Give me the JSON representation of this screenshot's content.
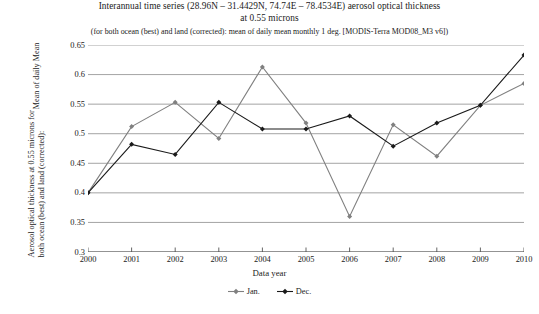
{
  "chart_data": {
    "type": "line",
    "title": "Interannual time series (28.96N – 31.4429N, 74.74E – 78.4534E) aerosol optical thickness",
    "title_line2": "at 0.55 microns",
    "subtitle": "(for both ocean (best) and land (corrected): mean of daily mean monthly 1 deg. [MODIS-Terra MOD08_M3 v6])",
    "xlabel": "Data year",
    "ylabel_line1": "Aerosol optical thickness at 0.55 microns for",
    "ylabel_line2": "both ocean (best) and land (corrected):",
    "ylabel_line3": "Mean of daily Mean",
    "categories": [
      2000,
      2001,
      2002,
      2003,
      2004,
      2005,
      2006,
      2007,
      2008,
      2009,
      2010
    ],
    "x": [
      "2000",
      "2001",
      "2002",
      "2003",
      "2004",
      "2005",
      "2006",
      "2007",
      "2008",
      "2009",
      "2010"
    ],
    "xlim": [
      2000,
      2010
    ],
    "ylim": [
      0.3,
      0.65
    ],
    "yticks": [
      "0.3",
      "0.35",
      "0.4",
      "0.45",
      "0.5",
      "0.55",
      "0.6",
      "0.65"
    ],
    "ytick_values": [
      0.3,
      0.35,
      0.4,
      0.45,
      0.5,
      0.55,
      0.6,
      0.65
    ],
    "grid": true,
    "legend_position": "bottom",
    "series": [
      {
        "name": "Jan.",
        "color": "#808080",
        "values": [
          0.4,
          0.512,
          0.553,
          0.492,
          0.613,
          0.518,
          0.36,
          0.515,
          0.462,
          0.548,
          0.585
        ]
      },
      {
        "name": "Dec.",
        "color": "#1a1a1a",
        "values": [
          0.4,
          0.482,
          0.465,
          0.553,
          0.508,
          0.508,
          0.53,
          0.479,
          0.518,
          0.548,
          0.633
        ]
      }
    ]
  },
  "legend": {
    "items": [
      {
        "label": "Jan.",
        "color": "#808080"
      },
      {
        "label": "Dec.",
        "color": "#1a1a1a"
      }
    ]
  }
}
